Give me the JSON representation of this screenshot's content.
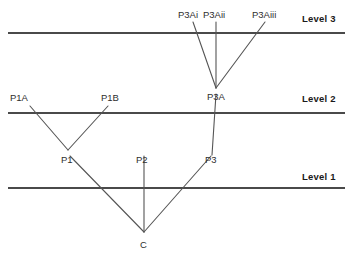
{
  "figure": {
    "type": "hierarchy-diagram",
    "width": 353,
    "height": 259,
    "background_color": "#ffffff",
    "line_color": "#4a4a4a",
    "branch_color": "#555555",
    "text_color": "#2e2e2e"
  },
  "levels": [
    {
      "id": "level3",
      "label": "Level 3",
      "y": 33,
      "x1": 8,
      "x2": 345,
      "label_x": 302,
      "label_y": 22
    },
    {
      "id": "level2",
      "label": "Level 2",
      "y": 113,
      "x1": 8,
      "x2": 345,
      "label_x": 302,
      "label_y": 102
    },
    {
      "id": "level1",
      "label": "Level 1",
      "y": 188,
      "x1": 8,
      "x2": 345,
      "label_x": 302,
      "label_y": 180
    }
  ],
  "nodes": [
    {
      "id": "p3ai",
      "label": "P3Ai",
      "x": 193,
      "y": 20,
      "label_x": 178,
      "label_y": 18
    },
    {
      "id": "p3aii",
      "label": "P3Aii",
      "x": 216,
      "y": 20,
      "label_x": 203,
      "label_y": 18
    },
    {
      "id": "p3aiii",
      "label": "P3Aiii",
      "x": 265,
      "y": 20,
      "label_x": 252,
      "label_y": 18
    },
    {
      "id": "p3a",
      "label": "P3A",
      "x": 216,
      "y": 88,
      "label_x": 207,
      "label_y": 100
    },
    {
      "id": "p1a",
      "label": "P1A",
      "x": 30,
      "y": 104,
      "label_x": 10,
      "label_y": 101
    },
    {
      "id": "p1b",
      "label": "P1B",
      "x": 108,
      "y": 104,
      "label_x": 101,
      "label_y": 101
    },
    {
      "id": "p1",
      "label": "P1",
      "x": 68,
      "y": 150,
      "label_x": 61,
      "label_y": 163
    },
    {
      "id": "p2",
      "label": "P2",
      "x": 144,
      "y": 160,
      "label_x": 136,
      "label_y": 163
    },
    {
      "id": "p3",
      "label": "P3",
      "x": 212,
      "y": 160,
      "label_x": 205,
      "label_y": 163
    },
    {
      "id": "c",
      "label": "C",
      "x": 144,
      "y": 232,
      "label_x": 140,
      "label_y": 248
    }
  ],
  "edges": [
    {
      "id": "e-p3ai-p3a",
      "from": "P3Ai",
      "to": "P3A",
      "x1": 193,
      "y1": 22,
      "x2": 216,
      "y2": 88
    },
    {
      "id": "e-p3aii-p3a",
      "from": "P3Aii",
      "to": "P3A",
      "x1": 216,
      "y1": 22,
      "x2": 216,
      "y2": 88
    },
    {
      "id": "e-p3aiii-p3a",
      "from": "P3Aiii",
      "to": "P3A",
      "x1": 265,
      "y1": 22,
      "x2": 216,
      "y2": 88
    },
    {
      "id": "e-p3a-p3",
      "from": "P3A",
      "to": "P3",
      "x1": 216,
      "y1": 94,
      "x2": 212,
      "y2": 155
    },
    {
      "id": "e-p1a-p1",
      "from": "P1A",
      "to": "P1",
      "x1": 30,
      "y1": 106,
      "x2": 68,
      "y2": 150
    },
    {
      "id": "e-p1b-p1",
      "from": "P1B",
      "to": "P1",
      "x1": 108,
      "y1": 106,
      "x2": 68,
      "y2": 150
    },
    {
      "id": "e-p1-c",
      "from": "P1",
      "to": "C",
      "x1": 70,
      "y1": 156,
      "x2": 144,
      "y2": 232
    },
    {
      "id": "e-p2-c",
      "from": "P2",
      "to": "C",
      "x1": 144,
      "y1": 156,
      "x2": 144,
      "y2": 232
    },
    {
      "id": "e-p3-c",
      "from": "P3",
      "to": "C",
      "x1": 211,
      "y1": 156,
      "x2": 144,
      "y2": 232
    }
  ]
}
